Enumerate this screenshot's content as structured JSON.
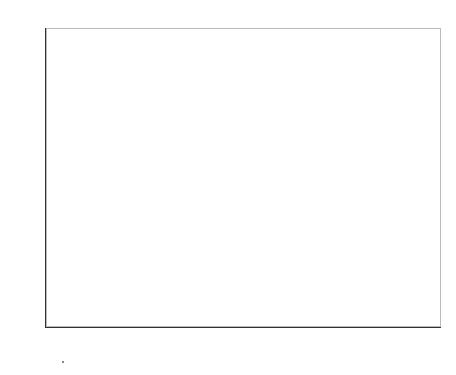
{
  "chart_data": {
    "type": "heatmap",
    "xlabel": "x",
    "ylabel": "y",
    "xlim": [
      -10,
      10
    ],
    "ylim": [
      -10,
      10
    ],
    "grid": false,
    "colormap": "gray",
    "x_ticks": [
      "-10",
      "-8",
      "-6",
      "-4",
      "-2",
      "0",
      "2",
      "4",
      "6",
      "8",
      "10"
    ],
    "y_ticks": [
      "10",
      "8",
      "6",
      "4",
      "2",
      "0",
      "-2",
      "-4",
      "-6",
      "-8",
      "-10"
    ],
    "rows_top_to_bottom_y": [
      9.5,
      8.5,
      7.5,
      6.5,
      5.5,
      4.5,
      3.5,
      2.5,
      1.5,
      0.5,
      -0.5,
      -1.5,
      -2.5,
      -3.5,
      -4.5,
      -5.5,
      -6.5,
      -7.5,
      -8.5,
      -9.5
    ],
    "columns_left_to_right_x": [
      -9.5,
      -8.5,
      -7.5,
      -6.5,
      -5.5,
      -4.5,
      -3.5,
      -2.5,
      -1.5,
      -0.5,
      0.5,
      1.5,
      2.5,
      3.5,
      4.5,
      5.5,
      6.5,
      7.5,
      8.5,
      9.5
    ],
    "values": [
      [
        0.5,
        0.25,
        0.5,
        0.9,
        0.15,
        0.5,
        0.4,
        0.3,
        0.3,
        0.35,
        0.4,
        0.4,
        0.55,
        0.2,
        0.4,
        0.3,
        0.45,
        0.45,
        0.3,
        0.35
      ],
      [
        0.25,
        0.5,
        0.45,
        0.5,
        0.5,
        0.3,
        0.25,
        0.3,
        0.3,
        0.4,
        0.45,
        0.6,
        0.25,
        0.6,
        0.3,
        0.5,
        0.15,
        0.7,
        0.55,
        0.3
      ],
      [
        0.3,
        0.3,
        0.5,
        0.4,
        0.5,
        0.25,
        0.55,
        0.45,
        0.6,
        0.5,
        0.15,
        0.4,
        0.25,
        0.3,
        0.45,
        0.15,
        0.35,
        0.75,
        0.75,
        0.4
      ],
      [
        0.3,
        0.35,
        0.2,
        0.45,
        0.25,
        0.55,
        0.5,
        0.25,
        0.45,
        0.45,
        0.75,
        0.95,
        0.5,
        0.3,
        0.3,
        0.25,
        0.35,
        0.55,
        0.4,
        0.45
      ],
      [
        0.4,
        0.55,
        0.4,
        0.5,
        0.6,
        0.25,
        0.35,
        0.3,
        0.15,
        0.15,
        0.45,
        0.45,
        0.5,
        0.25,
        0.35,
        0.35,
        0.25,
        0.5,
        0.25,
        0.6
      ],
      [
        0.7,
        0.5,
        0.92,
        0.5,
        0.15,
        0.35,
        0.3,
        0.5,
        0.45,
        0.65,
        0.45,
        0.4,
        0.25,
        0.45,
        0.55,
        0.5,
        0.15,
        0.5,
        0.6,
        0.2
      ],
      [
        0.5,
        0.5,
        0.45,
        0.45,
        0.15,
        0.15,
        0.55,
        0.3,
        0.15,
        0.45,
        0.45,
        0.5,
        0.45,
        0.45,
        0.55,
        0.35,
        0.92,
        0.5,
        0.5,
        0.5
      ],
      [
        0.3,
        0.25,
        0.3,
        0.3,
        0.5,
        0.3,
        0.5,
        0.45,
        0.15,
        0.2,
        0.45,
        0.15,
        0.15,
        0.5,
        0.5,
        0.4,
        0.7,
        0.3,
        0.3,
        0.45
      ],
      [
        0.45,
        0.3,
        0.3,
        0.35,
        0.5,
        0.5,
        0.5,
        0.45,
        0.7,
        0.2,
        0.45,
        0.3,
        0.5,
        0.85,
        0.35,
        0.5,
        0.5,
        0.4,
        0.3,
        0.15
      ],
      [
        0.6,
        0.45,
        0.4,
        0.6,
        0.6,
        0.15,
        0.5,
        0.3,
        0.5,
        0.45,
        0.45,
        0.65,
        0.35,
        0.5,
        0.5,
        0.5,
        0.5,
        0.3,
        0.5,
        0.15
      ],
      [
        0.15,
        0.45,
        0.5,
        0.45,
        0.55,
        0.5,
        0.75,
        0.35,
        0.55,
        0.4,
        0.35,
        0.5,
        0.3,
        0.4,
        0.4,
        0.75,
        0.15,
        0.45,
        0.72,
        0.2
      ],
      [
        0.15,
        0.5,
        0.5,
        0.25,
        0.25,
        0.45,
        0.45,
        0.45,
        0.3,
        0.3,
        0.6,
        0.25,
        0.55,
        0.12,
        0.4,
        0.4,
        0.4,
        0.4,
        0.75,
        0.75
      ],
      [
        0.7,
        0.92,
        0.92,
        0.5,
        0.35,
        0.25,
        0.25,
        0.3,
        0.3,
        0.45,
        0.5,
        0.45,
        0.3,
        0.45,
        0.55,
        0.5,
        0.55,
        0.45,
        0.45,
        0.4
      ],
      [
        0.25,
        0.5,
        0.55,
        0.5,
        0.25,
        0.25,
        0.3,
        0.5,
        0.3,
        0.25,
        0.25,
        0.25,
        0.25,
        0.35,
        0.35,
        0.45,
        0.4,
        0.25,
        0.25,
        0.6
      ],
      [
        0.3,
        0.35,
        0.3,
        0.45,
        0.4,
        0.55,
        0.5,
        0.55,
        0.65,
        0.5,
        0.45,
        0.45,
        0.4,
        0.35,
        0.35,
        0.72,
        0.15,
        0.35,
        0.45,
        0.35
      ],
      [
        0.5,
        0.3,
        0.5,
        0.45,
        0.3,
        0.55,
        0.5,
        0.25,
        0.45,
        0.15,
        0.15,
        0.85,
        0.7,
        0.3,
        0.45,
        0.45,
        0.15,
        0.35,
        0.35,
        0.35
      ],
      [
        0.6,
        0.4,
        0.5,
        0.3,
        0.3,
        0.25,
        0.5,
        0.25,
        0.45,
        0.45,
        0.45,
        0.85,
        0.45,
        0.5,
        0.45,
        0.45,
        0.25,
        0.4,
        0.4,
        0.35
      ],
      [
        0.25,
        0.45,
        0.45,
        0.6,
        0.25,
        0.35,
        0.25,
        0.6,
        0.45,
        0.65,
        0.4,
        0.5,
        0.5,
        0.15,
        0.45,
        0.45,
        0.3,
        0.55,
        0.4,
        0.5
      ],
      [
        0.45,
        0.45,
        0.45,
        0.45,
        0.6,
        0.3,
        0.3,
        0.3,
        0.3,
        0.35,
        0.4,
        0.3,
        0.35,
        0.45,
        0.55,
        0.45,
        0.3,
        0.5,
        0.4,
        0.25
      ],
      [
        0.3,
        0.5,
        0.1,
        0.1,
        0.45,
        0.45,
        0.5,
        0.5,
        0.3,
        0.5,
        0.4,
        0.3,
        0.55,
        0.5,
        0.4,
        0.5,
        0.5,
        0.45,
        0.3,
        0.25
      ]
    ]
  }
}
